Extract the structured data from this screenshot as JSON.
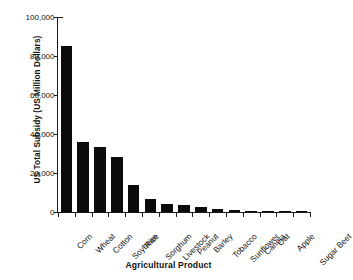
{
  "chart_data": {
    "type": "bar",
    "title": "",
    "xlabel": "Agricultural Product",
    "ylabel": "US Total Subsidy (US Million Dollars)",
    "categories": [
      "Corn",
      "Wheat",
      "Cotton",
      "Soybean",
      "Rice",
      "Sorghum",
      "Livestock",
      "Peanut",
      "Barley",
      "Tobacco",
      "Sunflower",
      "Canola",
      "Oat",
      "Apple",
      "Sugar Beet"
    ],
    "values": [
      85000,
      35900,
      33300,
      28200,
      13800,
      6600,
      4100,
      3600,
      2600,
      1600,
      1000,
      600,
      400,
      300,
      200
    ],
    "ylim": [
      0,
      100000
    ],
    "yticks": [
      0,
      20000,
      40000,
      60000,
      80000,
      100000
    ],
    "ytick_labels": [
      "0",
      "20,000",
      "40,000",
      "60,000",
      "80,000",
      "100,000"
    ],
    "grid": false,
    "legend": null,
    "bar_color": "#0b0b0b",
    "background_color": "#ffffff",
    "axis_color": "#1a1a1a"
  }
}
